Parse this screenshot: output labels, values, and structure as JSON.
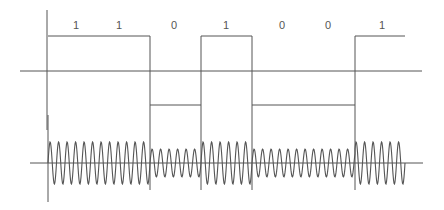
{
  "diagram": {
    "title": "",
    "bits": [
      "1",
      "1",
      "0",
      "1",
      "0",
      "0",
      "1"
    ],
    "bit_label_x": [
      76,
      119,
      174,
      226,
      282,
      328,
      382
    ],
    "transitions_x": [
      48,
      150,
      201,
      252,
      355,
      405
    ],
    "line_color": "#555555",
    "signal": {
      "high_y": 36,
      "low_y": 105,
      "baseline_y": 71,
      "segments": [
        {
          "x0": 48,
          "x1": 150,
          "level": "high"
        },
        {
          "x0": 150,
          "x1": 201,
          "level": "low"
        },
        {
          "x0": 201,
          "x1": 252,
          "level": "high"
        },
        {
          "x0": 252,
          "x1": 355,
          "level": "low"
        },
        {
          "x0": 355,
          "x1": 405,
          "level": "high"
        }
      ]
    },
    "modulated": {
      "center_y": 163,
      "high_amplitude": 21,
      "low_amplitude": 14,
      "cycle_px": 8.5
    }
  }
}
